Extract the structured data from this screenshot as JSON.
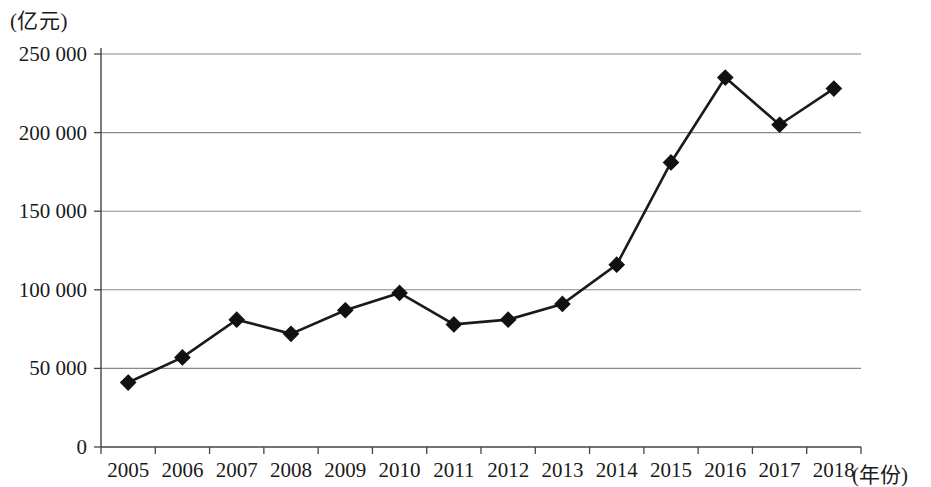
{
  "chart_data": {
    "type": "line",
    "title": "",
    "subtitle": "",
    "ylabel": "(亿元)",
    "xlabel": "(年份)",
    "categories": [
      "2005",
      "2006",
      "2007",
      "2008",
      "2009",
      "2010",
      "2011",
      "2012",
      "2013",
      "2014",
      "2015",
      "2016",
      "2017",
      "2018"
    ],
    "values": [
      41000,
      57000,
      81000,
      72000,
      87000,
      98000,
      78000,
      81000,
      91000,
      116000,
      181000,
      235000,
      205000,
      228000
    ],
    "series": [
      {
        "name": "",
        "values": [
          41000,
          57000,
          81000,
          72000,
          87000,
          98000,
          78000,
          81000,
          91000,
          116000,
          181000,
          235000,
          205000,
          228000
        ]
      }
    ],
    "ylim": [
      0,
      250000
    ],
    "yticks": [
      0,
      50000,
      100000,
      150000,
      200000,
      250000
    ],
    "ytick_labels": [
      "0",
      "50 000",
      "100 000",
      "150 000",
      "200 000",
      "250 000"
    ],
    "xtick_labels": [
      "2005",
      "2006",
      "2007",
      "2008",
      "2009",
      "2010",
      "2011",
      "2012",
      "2013",
      "2014",
      "2015",
      "2016",
      "2017",
      "2018"
    ],
    "grid": true,
    "grid_axis": "y",
    "legend": false,
    "legend_position": "none",
    "marker": "diamond",
    "line_color": "#1a1a1a",
    "marker_color": "#111111",
    "grid_color": "#8a8a8a",
    "background_color": "#ffffff"
  }
}
